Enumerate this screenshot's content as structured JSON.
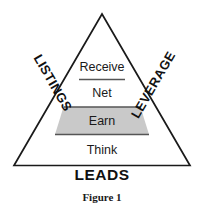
{
  "figure": {
    "caption": "Figure 1",
    "diagram_type": "pyramid",
    "background_color": "#ffffff",
    "outline_color": "#1a1a1a",
    "tiers": [
      {
        "label": "Receive",
        "level": 4,
        "fill": "#ffffff",
        "highlighted": false
      },
      {
        "label": "Net",
        "level": 3,
        "fill": "#ffffff",
        "highlighted": false
      },
      {
        "label": "Earn",
        "level": 2,
        "fill": "#c9c9c9",
        "highlighted": true
      },
      {
        "label": "Think",
        "level": 1,
        "fill": "#ffffff",
        "highlighted": false
      }
    ],
    "side_labels": {
      "left": "LISTINGS",
      "right": "LEVERAGE"
    },
    "base_label": "LEADS"
  }
}
